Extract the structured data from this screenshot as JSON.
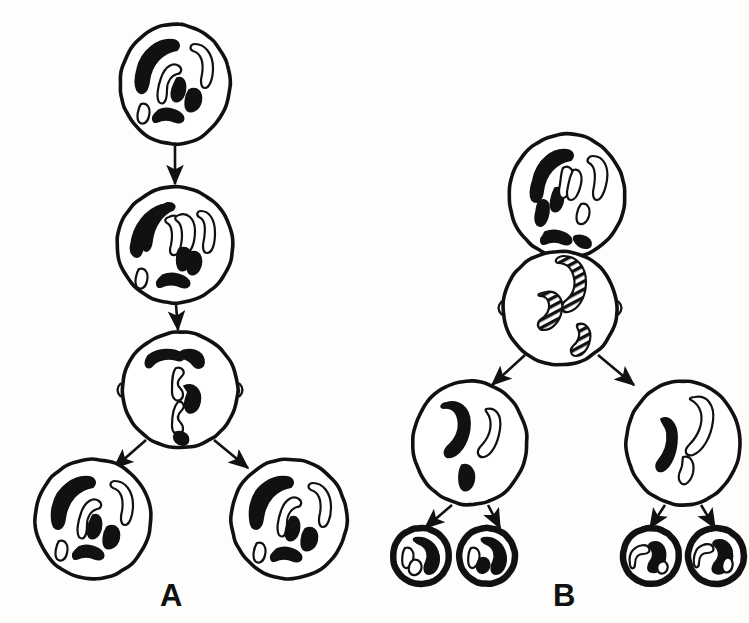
{
  "figure": {
    "background_color": "#fdfdfc",
    "ink_color": "#111111",
    "chromosome_fill_dark": "#111111",
    "chromosome_fill_light": "#ffffff",
    "width": 749,
    "height": 623
  },
  "panels": [
    {
      "id": "A",
      "label": "A",
      "process": "mitosis",
      "label_x": 160,
      "label_y": 578,
      "stages": [
        {
          "name": "parent-cell-interphase",
          "cx": 175,
          "cy": 84,
          "rx": 55,
          "ry": 60,
          "chromosome_count": 6,
          "ploidy": "diploid",
          "spindle": false,
          "chromosomes": [
            {
              "shade": "dark",
              "path": "M -38 -14 C -34 -34, -16 -46, -2 -44 C 4 -43, 6 -38, 2 -34 C -12 -32, -24 -20, -26 -2 C -28 10, -34 12, -38 6 C -41 0, -40 -6, -38 -14 Z"
            },
            {
              "shade": "light",
              "path": "M -14 -6 C -10 -18, -2 -22, 4 -18 C 8 -15, 6 -10, 2 -10 C -4 -8, -8 -2, -8 6 C -8 18, -12 22, -16 18 C -19 13, -17 2, -14 -6 Z"
            },
            {
              "shade": "light",
              "path": "M 20 -40 C 30 -40, 38 -30, 38 -16 C 38 -4, 34 4, 30 4 C 26 4, 25 -2, 27 -10 C 29 -22, 26 -31, 18 -33 C 14 -35, 15 -40, 20 -40 Z"
            },
            {
              "shade": "dark",
              "path": "M 2 -6 C 8 -8, 12 -2, 10 8 C 8 16, 2 20, -2 16 C -5 12, -3 4, 0 -2 Z"
            },
            {
              "shade": "dark",
              "path": "M 14 6 C 22 2, 28 8, 26 18 C 24 26, 16 30, 12 26 C 9 22, 10 12, 14 6 Z"
            },
            {
              "shade": "dark",
              "path": "M -16 26 C -8 22, 4 26, 8 32 C 10 37, 6 40, 0 38 C -8 34, -14 36, -18 38 C -22 39, -24 34, -20 30 Z"
            },
            {
              "shade": "light",
              "path": "M -34 20 C -28 18, -24 24, -26 32 C -27 38, -32 42, -36 38 C -39 34, -37 24, -34 20 Z"
            }
          ]
        },
        {
          "name": "prophase-duplicated-chromosomes",
          "cx": 175,
          "cy": 245,
          "rx": 58,
          "ry": 58,
          "chromosome_count": 6,
          "ploidy": "diploid",
          "spindle": false,
          "chromosomes": [
            {
              "shade": "dark",
              "path": "M -44 0 C -42 -20, -28 -36, -14 -40 C -8 -41, -4 -37, -8 -33 C -20 -29, -30 -16, -32 2 C -33 12, -38 14, -42 10 C -45 7, -45 4, -44 0 Z"
            },
            {
              "shade": "dark",
              "path": "M -34 -6 C -32 -24, -20 -38, -8 -42 C -2 -43, 2 -39, -2 -35 C -12 -31, -21 -20, -23 -4 C -24 6, -29 8, -32 4 C -35 1, -35 -2, -34 -6 Z"
            },
            {
              "shade": "light",
              "path": "M -6 -28 C 2 -32, 10 -26, 10 -14 C 10 -2, 6 8, 0 10 C -5 11, -6 6, -4 0 C -2 -10, -3 -20, -8 -22 C -11 -24, -10 -27, -6 -28 Z"
            },
            {
              "shade": "light",
              "path": "M 4 -30 C 12 -33, 20 -27, 20 -14 C 20 -2, 16 8, 10 10 C 5 11, 4 6, 6 0 C 8 -10, 7 -21, 2 -24 C -1 -26, 0 -29, 4 -30 Z"
            },
            {
              "shade": "light",
              "path": "M 26 -34 C 34 -34, 40 -26, 40 -12 C 40 0, 37 8, 32 8 C 28 8, 27 2, 29 -6 C 31 -18, 29 -26, 24 -28 C 21 -30, 22 -34, 26 -34 Z"
            },
            {
              "shade": "dark",
              "path": "M 4 4 C 12 0, 18 6, 16 16 C 14 24, 8 28, 4 24 C 1 20, 1 10, 4 4 Z"
            },
            {
              "shade": "dark",
              "path": "M 14 8 C 22 4, 28 10, 26 20 C 24 28, 18 32, 14 28 C 11 24, 11 14, 14 8 Z"
            },
            {
              "shade": "dark",
              "path": "M -12 30 C -2 26, 10 30, 14 36 C 16 41, 12 44, 6 42 C -2 38, -10 40, -14 42 C -18 43, -20 38, -16 34 Z"
            },
            {
              "shade": "light",
              "path": "M -36 24 C -30 22, -26 28, -28 36 C -29 42, -34 46, -38 42 C -41 38, -39 28, -36 24 Z"
            }
          ]
        },
        {
          "name": "metaphase-anaphase-spindle",
          "cx": 180,
          "cy": 390,
          "rx": 58,
          "ry": 58,
          "chromosome_count": 6,
          "ploidy": "diploid",
          "spindle": true,
          "chromosomes": [
            {
              "shade": "dark",
              "path": "M -32 -34 C -22 -42, -6 -42, 2 -36 C 6 -32, 2 -28, -4 -30 C -14 -33, -24 -29, -28 -24 C -32 -20, -36 -24, -34 -30 Z"
            },
            {
              "shade": "dark",
              "path": "M 6 -40 C 16 -42, 24 -36, 24 -28 C 24 -22, 18 -20, 14 -24 C 10 -30, 4 -32, 0 -32 C -4 -33, -1 -39, 6 -40 Z"
            },
            {
              "shade": "dark",
              "path": "M 4 -4 C 14 -8, 22 0, 20 12 C 18 22, 10 26, 6 20 C 3 14, 6 8, 8 2 Z"
            },
            {
              "shade": "light",
              "path": "M -4 -22 C 2 -24, 6 -18, 2 -14 C -2 -10, -4 -6, 0 -2 C 4 2, 4 8, 0 10 C -4 12, -8 8, -8 2 C -8 -8, -8 -18, -4 -22 Z"
            },
            {
              "shade": "light",
              "path": "M -2 12 C 2 10, 6 16, 2 20 C -2 24, -4 28, 0 32 C 4 36, 4 42, 0 44 C -4 46, -8 42, -8 36 C -8 26, -6 16, -2 12 Z"
            },
            {
              "shade": "dark",
              "path": "M -4 42 C 4 40, 10 46, 8 52 C 6 56, 0 56, -4 52 C -7 49, -7 44, -4 42 Z"
            }
          ]
        },
        {
          "name": "daughter-cell-left",
          "cx": 93,
          "cy": 519,
          "rx": 58,
          "ry": 60,
          "chromosome_count": 6,
          "ploidy": "diploid",
          "spindle": false,
          "chromosomes": [
            {
              "shade": "dark",
              "path": "M -40 -14 C -36 -32, -18 -44, -4 -42 C 2 -41, 4 -36, 0 -32 C -14 -30, -26 -18, -28 0 C -29 10, -35 12, -39 8 C -42 3, -42 -8, -40 -14 Z"
            },
            {
              "shade": "light",
              "path": "M -12 -6 C -8 -18, 0 -22, 6 -18 C 10 -15, 8 -10, 4 -10 C -2 -8, -6 -2, -6 6 C -6 18, -10 22, -14 18 C -17 13, -15 2, -12 -6 Z"
            },
            {
              "shade": "light",
              "path": "M 22 -38 C 32 -38, 40 -28, 40 -14 C 40 -2, 36 6, 32 6 C 28 6, 27 0, 29 -8 C 31 -20, 28 -29, 20 -31 C 16 -33, 17 -38, 22 -38 Z"
            },
            {
              "shade": "dark",
              "path": "M 0 -4 C 6 -6, 10 0, 8 10 C 6 18, 0 22, -4 18 C -7 14, -5 6, -2 0 Z"
            },
            {
              "shade": "dark",
              "path": "M 14 8 C 22 4, 28 10, 26 20 C 24 28, 16 32, 12 28 C 9 24, 10 14, 14 8 Z"
            },
            {
              "shade": "dark",
              "path": "M -14 28 C -6 24, 6 28, 10 34 C 12 39, 8 42, 2 40 C -6 36, -12 38, -16 40 C -20 41, -22 36, -18 32 Z"
            },
            {
              "shade": "light",
              "path": "M -34 22 C -28 20, -24 26, -26 34 C -27 40, -32 44, -36 40 C -39 36, -37 26, -34 22 Z"
            }
          ]
        },
        {
          "name": "daughter-cell-right",
          "cx": 289,
          "cy": 519,
          "rx": 58,
          "ry": 60,
          "chromosome_count": 6,
          "ploidy": "diploid",
          "spindle": false,
          "chromosomes": [
            {
              "shade": "dark",
              "path": "M -38 -16 C -34 -34, -16 -44, -2 -42 C 4 -41, 6 -36, 2 -32 C -12 -30, -24 -18, -26 0 C -27 10, -33 12, -37 8 C -40 3, -40 -10, -38 -16 Z"
            },
            {
              "shade": "light",
              "path": "M -8 -8 C -4 -20, 4 -24, 10 -20 C 14 -17, 12 -12, 8 -12 C 2 -10, -2 -4, -2 4 C -2 16, -6 20, -10 16 C -13 11, -11 0, -8 -8 Z"
            },
            {
              "shade": "light",
              "path": "M 24 -36 C 34 -36, 42 -26, 42 -12 C 42 0, 38 8, 34 8 C 30 8, 29 2, 31 -6 C 33 -18, 30 -27, 22 -29 C 18 -31, 19 -36, 24 -36 Z"
            },
            {
              "shade": "dark",
              "path": "M 2 -2 C 8 -4, 12 2, 10 12 C 8 20, 2 24, -2 20 C -5 16, -3 8, 0 2 Z"
            },
            {
              "shade": "dark",
              "path": "M 16 10 C 24 6, 30 12, 28 22 C 26 30, 18 34, 14 30 C 11 26, 12 16, 16 10 Z"
            },
            {
              "shade": "dark",
              "path": "M -12 30 C -4 26, 8 30, 12 36 C 14 41, 10 44, 4 42 C -4 38, -10 40, -14 42 C -18 43, -20 38, -16 34 Z"
            },
            {
              "shade": "light",
              "path": "M -32 24 C -26 22, -22 28, -24 36 C -25 42, -30 46, -34 42 C -37 38, -35 28, -32 24 Z"
            }
          ]
        }
      ],
      "arrows": [
        {
          "name": "arrow-parent-to-prophase",
          "x1": 175,
          "y1": 146,
          "x2": 175,
          "y2": 184
        },
        {
          "name": "arrow-prophase-to-metaphase",
          "x1": 176,
          "y1": 305,
          "x2": 178,
          "y2": 330
        },
        {
          "name": "arrow-metaphase-to-daughter-left",
          "x1": 146,
          "y1": 440,
          "x2": 114,
          "y2": 468
        },
        {
          "name": "arrow-metaphase-to-daughter-right",
          "x1": 214,
          "y1": 440,
          "x2": 248,
          "y2": 468
        }
      ]
    },
    {
      "id": "B",
      "label": "B",
      "process": "meiosis",
      "label_x": 553,
      "label_y": 578,
      "stages": [
        {
          "name": "parent-cell-interphase",
          "cx": 567,
          "cy": 196,
          "rx": 58,
          "ry": 62,
          "chromosome_count": 6,
          "ploidy": "diploid",
          "spindle": false,
          "chromosomes": [
            {
              "shade": "dark",
              "path": "M -34 -16 C -30 -36, -14 -48, 0 -46 C 6 -45, 8 -40, 4 -36 C -10 -34, -22 -22, -24 -4 C -25 6, -31 8, -35 4 C -38 -1, -36 -10, -34 -16 Z"
            },
            {
              "shade": "dark",
              "path": "M -28 6 C -24 2, -18 4, -18 12 C -18 22, -22 30, -27 30 C -31 30, -33 24, -31 16 C -30 11, -30 8, -28 6 Z"
            },
            {
              "shade": "dark",
              "path": "M -12 -8 C -6 -10, -2 -4, -4 6 C -6 14, -11 18, -15 14 C -18 10, -16 0, -12 -8 Z"
            },
            {
              "shade": "light",
              "path": "M -4 -28 C 2 -32, 8 -26, 6 -16 C 4 -6, 0 2, -4 2 C -8 2, -9 -4, -7 -12 C -6 -18, -6 -24, -4 -28 Z"
            },
            {
              "shade": "light",
              "path": "M 6 -26 C 12 -28, 16 -22, 14 -12 C 12 -2, 8 4, 4 4 C 0 4, -1 -2, 1 -10 C 2 -16, 4 -22, 6 -26 Z"
            },
            {
              "shade": "light",
              "path": "M 26 -40 C 36 -40, 42 -30, 40 -16 C 38 -4, 34 4, 30 4 C 26 4, 25 -2, 27 -10 C 29 -22, 28 -30, 22 -33 C 19 -35, 21 -40, 26 -40 Z"
            },
            {
              "shade": "light",
              "path": "M 14 8 C 20 6, 24 12, 22 20 C 20 27, 15 30, 11 27 C 8 23, 10 13, 14 8 Z"
            },
            {
              "shade": "dark",
              "path": "M -22 36 C -12 32, 0 36, 4 42 C 6 47, 2 50, -4 48 C -12 44, -18 46, -22 48 C -26 49, -28 44, -24 40 Z"
            },
            {
              "shade": "dark",
              "path": "M 8 40 C 16 38, 24 42, 24 48 C 24 52, 18 54, 12 50 C 8 47, 5 42, 8 40 Z"
            }
          ]
        },
        {
          "name": "meiosis-I-metaphase-tetrads",
          "cx": 560,
          "cy": 308,
          "rx": 57,
          "ry": 57,
          "chromosome_count": 3,
          "ploidy": "diploid-paired",
          "spindle": true,
          "chromosomes": [
            {
              "shade": "striped",
              "path": "M 4 -52 C 16 -52, 26 -42, 26 -26 C 26 -10, 18 2, 8 4 C 2 5, 0 -1, 4 -6 C 12 -12, 16 -20, 14 -30 C 12 -40, 6 -45, -2 -45 C -7 -46, -3 -52, 4 -52 Z"
            },
            {
              "shade": "striped",
              "path": "M -14 -16 C -4 -18, 4 -10, 2 2 C 0 14, -8 22, -16 22 C -22 22, -24 16, -20 12 C -14 8, -10 2, -11 -4 C -12 -10, -16 -12, -20 -12 C -24 -13, -20 -15, -14 -16 Z"
            },
            {
              "shade": "striped",
              "path": "M 18 16 C 26 14, 32 22, 30 32 C 28 42, 22 48, 16 48 C 11 48, 9 42, 13 38 C 18 34, 20 28, 19 24 C 18 20, 15 18, 18 16 Z"
            }
          ]
        },
        {
          "name": "secondary-cell-left",
          "cx": 470,
          "cy": 443,
          "rx": 57,
          "ry": 62,
          "chromosome_count": 3,
          "ploidy": "haploid",
          "spindle": false,
          "chromosomes": [
            {
              "shade": "dark",
              "path": "M -24 -40 C -12 -44, 0 -36, 0 -20 C 0 -4, -8 10, -18 14 C -25 16, -28 10, -23 4 C -14 -4, -10 -14, -12 -24 C -14 -33, -20 -36, -26 -35 C -31 -35, -29 -39, -24 -40 Z"
            },
            {
              "shade": "light",
              "path": "M 16 -34 C 26 -36, 32 -28, 30 -14 C 28 0, 22 12, 14 14 C 8 15, 6 9, 10 4 C 18 -4, 22 -14, 20 -24 C 19 -30, 14 -32, 16 -34 Z"
            },
            {
              "shade": "dark",
              "path": "M -8 22 C 0 20, 6 28, 4 38 C 2 46, -4 50, -8 46 C -12 42, -12 28, -8 22 Z"
            }
          ]
        },
        {
          "name": "secondary-cell-right",
          "cx": 683,
          "cy": 443,
          "rx": 57,
          "ry": 62,
          "chromosome_count": 3,
          "ploidy": "haploid",
          "spindle": false,
          "chromosomes": [
            {
              "shade": "dark",
              "path": "M -22 -24 C -14 -28, -6 -20, -6 -6 C -6 10, -12 24, -20 28 C -26 30, -29 24, -25 18 C -18 10, -15 0, -16 -10 C -17 -18, -22 -20, -22 -24 Z"
            },
            {
              "shade": "light",
              "path": "M 12 -46 C 24 -48, 32 -38, 30 -22 C 28 -6, 20 8, 10 12 C 3 14, 0 8, 6 2 C 16 -8, 20 -20, 18 -30 C 16 -38, 10 -42, 8 -43 C 5 -44, 8 -46, 12 -46 Z"
            },
            {
              "shade": "light",
              "path": "M 0 14 C 8 12, 12 20, 10 30 C 8 38, 2 44, -2 40 C -6 36, -4 30, -2 26 C 0 22, -1 18, 0 14 Z"
            }
          ]
        },
        {
          "name": "gamete-1",
          "cx": 421,
          "cy": 556,
          "rx": 28,
          "ry": 28,
          "chromosome_count": 3,
          "ploidy": "haploid",
          "gamete": true,
          "spindle": false,
          "chromosomes": [
            {
              "shade": "dark",
              "path": "M -6 -18 C 6 -20, 16 -12, 18 0 C 19 10, 14 18, 8 18 C 3 18, 2 12, 5 6 C 8 0, 6 -8, 0 -11 C -5 -13, -10 -17, -6 -18 Z"
            },
            {
              "shade": "light",
              "path": "M -16 -8 C -10 -10, -6 -4, -8 4 C -10 10, -14 14, -17 11 C -20 8, -19 -4, -16 -8 Z"
            },
            {
              "shade": "light",
              "path": "M -8 4 C -2 2, 2 8, 0 14 C -2 19, -8 21, -11 17 C -14 13, -11 6, -8 4 Z"
            }
          ]
        },
        {
          "name": "gamete-2",
          "cx": 487,
          "cy": 556,
          "rx": 28,
          "ry": 28,
          "chromosome_count": 3,
          "ploidy": "haploid",
          "gamete": true,
          "spindle": false,
          "chromosomes": [
            {
              "shade": "dark",
              "path": "M -4 -18 C 8 -20, 17 -12, 19 0 C 20 10, 15 18, 9 18 C 4 18, 3 12, 6 6 C 9 0, 7 -8, 1 -11 C -4 -13, -8 -17, -4 -18 Z"
            },
            {
              "shade": "light",
              "path": "M -16 -8 C -10 -10, -6 -4, -8 4 C -10 10, -14 14, -17 11 C -20 8, -19 -4, -16 -8 Z"
            },
            {
              "shade": "dark",
              "path": "M -6 2 C 0 0, 4 6, 2 12 C 0 17, -6 19, -9 15 C -12 11, -9 4, -6 2 Z"
            }
          ]
        },
        {
          "name": "gamete-3",
          "cx": 651,
          "cy": 556,
          "rx": 28,
          "ry": 28,
          "chromosome_count": 3,
          "ploidy": "haploid",
          "gamete": true,
          "spindle": false,
          "chromosomes": [
            {
              "shade": "dark",
              "path": "M 4 -14 C 12 -14, 16 -6, 14 4 C 12 12, 6 18, 0 16 C -5 14, -3 8, 0 4 C 3 0, 2 -6, -1 -9 C -4 -11, 0 -14, 4 -14 Z"
            },
            {
              "shade": "light",
              "path": "M -18 -6 C -12 -12, -4 -12, -2 -8 C 0 -4, -4 -2, -8 -2 C -13 -2, -16 2, -16 8 C -16 13, -20 14, -21 9 C -22 3, -21 -3, -18 -6 Z"
            },
            {
              "shade": "light",
              "path": "M 10 6 C 15 4, 18 9, 16 14 C 14 18, 9 19, 7 15 C 5 11, 7 7, 10 6 Z"
            }
          ]
        },
        {
          "name": "gamete-4",
          "cx": 716,
          "cy": 556,
          "rx": 28,
          "ry": 28,
          "chromosome_count": 3,
          "ploidy": "haploid",
          "gamete": true,
          "spindle": false,
          "chromosomes": [
            {
              "shade": "dark",
              "path": "M 2 -16 C 12 -17, 18 -8, 16 4 C 14 14, 6 20, -1 17 C -6 14, -3 8, 1 4 C 4 0, 3 -7, -1 -10 C -5 -12, -2 -16, 2 -16 Z"
            },
            {
              "shade": "light",
              "path": "M -18 -8 C -12 -13, -5 -13, -3 -9 C -1 -5, -5 -3, -9 -3 C -14 -3, -17 1, -17 7 C -17 12, -21 13, -22 8 C -23 2, -21 -5, -18 -8 Z"
            },
            {
              "shade": "light",
              "path": "M 10 2 C 15 0, 18 6, 16 12 C 14 17, 9 18, 7 14 C 5 10, 7 4, 10 2 Z"
            }
          ]
        }
      ],
      "arrows": [
        {
          "name": "arrow-parent-to-meiosis-I",
          "x1": 567,
          "y1": 259,
          "x2": 564,
          "y2": 292
        },
        {
          "name": "arrow-meiosis-I-to-secondary-left",
          "x1": 525,
          "y1": 355,
          "x2": 492,
          "y2": 385
        },
        {
          "name": "arrow-meiosis-I-to-secondary-right",
          "x1": 598,
          "y1": 355,
          "x2": 634,
          "y2": 385
        },
        {
          "name": "arrow-secondary-left-to-gamete-1",
          "x1": 452,
          "y1": 505,
          "x2": 425,
          "y2": 528
        },
        {
          "name": "arrow-secondary-left-to-gamete-2",
          "x1": 488,
          "y1": 505,
          "x2": 500,
          "y2": 528
        },
        {
          "name": "arrow-secondary-right-to-gamete-3",
          "x1": 665,
          "y1": 505,
          "x2": 650,
          "y2": 528
        },
        {
          "name": "arrow-secondary-right-to-gamete-4",
          "x1": 701,
          "y1": 505,
          "x2": 715,
          "y2": 528
        }
      ]
    }
  ]
}
